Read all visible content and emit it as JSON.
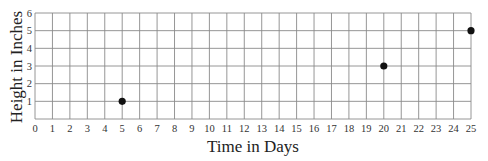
{
  "chart_data": {
    "type": "scatter",
    "title": "",
    "xlabel": "Time in Days",
    "ylabel": "Height in Inches",
    "xlim": [
      0,
      25
    ],
    "ylim": [
      0,
      6
    ],
    "x_ticks": [
      0,
      1,
      2,
      3,
      4,
      5,
      6,
      7,
      8,
      9,
      10,
      11,
      12,
      13,
      14,
      15,
      16,
      17,
      18,
      19,
      20,
      21,
      22,
      23,
      24,
      25
    ],
    "y_ticks": [
      1,
      2,
      3,
      4,
      5,
      6
    ],
    "grid": true,
    "legend": null,
    "series": [
      {
        "name": "Height",
        "points": [
          {
            "x": 5,
            "y": 1
          },
          {
            "x": 20,
            "y": 3
          },
          {
            "x": 25,
            "y": 5
          }
        ]
      }
    ],
    "colors": {
      "grid": "#8a8a8a",
      "point": "#111111",
      "text": "#333333"
    }
  }
}
